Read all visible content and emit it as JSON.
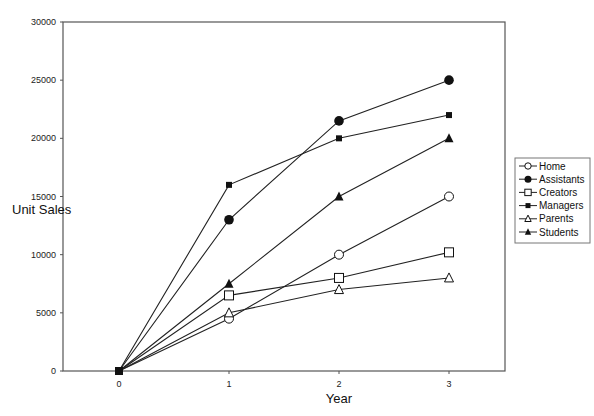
{
  "chart_data": {
    "type": "line",
    "title": "",
    "xlabel": "Year",
    "ylabel": "Unit Sales",
    "x": [
      0,
      1,
      2,
      3
    ],
    "x_ticks": [
      "0",
      "1",
      "2",
      "3"
    ],
    "y_ticks": [
      "0",
      "5000",
      "10000",
      "15000",
      "20000",
      "25000",
      "30000"
    ],
    "ylim": [
      0,
      30000
    ],
    "xlim": [
      -1.0,
      3.5
    ],
    "grid": false,
    "legend_position": "right",
    "series": [
      {
        "name": "Home",
        "marker": "open-circle",
        "values": [
          0,
          4500,
          10000,
          15000
        ]
      },
      {
        "name": "Assistants",
        "marker": "filled-circle",
        "values": [
          0,
          13000,
          21500,
          25000
        ]
      },
      {
        "name": "Creators",
        "marker": "open-square",
        "values": [
          0,
          6500,
          8000,
          10200
        ]
      },
      {
        "name": "Managers",
        "marker": "filled-square",
        "values": [
          0,
          16000,
          20000,
          22000
        ]
      },
      {
        "name": "Parents",
        "marker": "open-triangle",
        "values": [
          0,
          5000,
          7000,
          8000
        ]
      },
      {
        "name": "Students",
        "marker": "filled-triangle",
        "values": [
          0,
          7500,
          15000,
          20000
        ]
      }
    ]
  }
}
